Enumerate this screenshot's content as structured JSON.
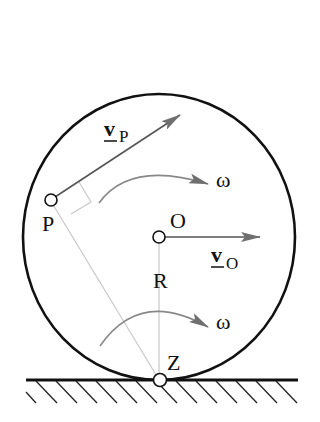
{
  "diagram": {
    "type": "rolling-wheel-kinematics",
    "points": {
      "P": {
        "label": "P"
      },
      "O": {
        "label": "O"
      },
      "Z": {
        "label": "Z"
      }
    },
    "vectors": {
      "v_P": {
        "symbol": "v",
        "subscript": "P",
        "underlined": true
      },
      "v_O": {
        "symbol": "v",
        "subscript": "O",
        "underlined": true
      }
    },
    "angular_velocity": {
      "upper": {
        "label": "ω"
      },
      "lower": {
        "label": "ω"
      }
    },
    "radius_label": "R",
    "colors": {
      "outline": "#111111",
      "arrow": "#777777",
      "construction_line": "#c8c8c8"
    }
  }
}
